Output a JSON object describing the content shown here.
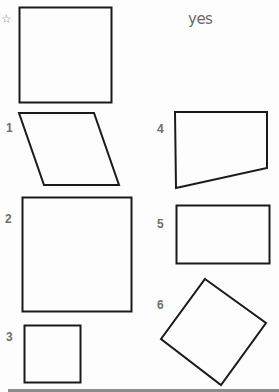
{
  "worksheet": {
    "example": {
      "marker_icon": "star-outline-icon",
      "marker_glyph": "☆",
      "answer": "yes",
      "shape": "square"
    },
    "items": [
      {
        "number": "1",
        "shape": "parallelogram"
      },
      {
        "number": "2",
        "shape": "square"
      },
      {
        "number": "3",
        "shape": "square"
      },
      {
        "number": "4",
        "shape": "trapezoid"
      },
      {
        "number": "5",
        "shape": "rectangle"
      },
      {
        "number": "6",
        "shape": "rotated-square"
      }
    ]
  },
  "colors": {
    "stroke": "#1a1a1a",
    "label": "#6e6e6e",
    "answer": "#6a6a6a",
    "rule": "#8c8c8c"
  }
}
